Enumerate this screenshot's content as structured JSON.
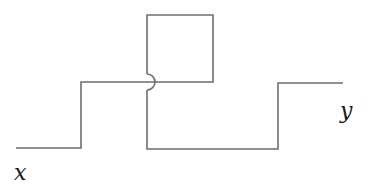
{
  "diagram": {
    "type": "line-crossing-diagram",
    "labels": {
      "x": "x",
      "y": "y"
    },
    "stroke_color": "#6e6e6e",
    "paths": {
      "path_x": "M16,148 L81,148 L81,82 L213,82 L213,15 L147,15 L147,74",
      "path_y_hop": "M147,74 A8,8 0 0 1 147,90",
      "path_y": "M147,90 L147,149 L278,149 L278,83 L343,83"
    }
  }
}
